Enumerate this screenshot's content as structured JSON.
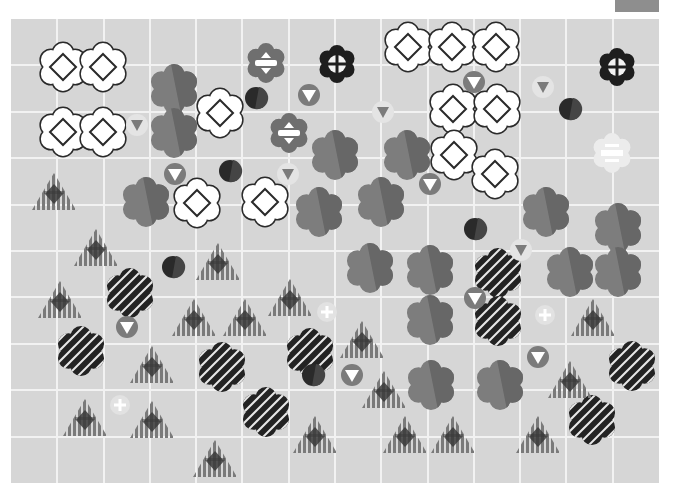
{
  "board": {
    "origin": [
      11,
      19
    ],
    "size": [
      648,
      464
    ],
    "columns": 14,
    "rows": 10,
    "colors": {
      "background": "#d6d6d6",
      "grid": "#f2f2f2",
      "corner_tab": "#8e8e8e",
      "white_flower_fill": "#ffffff",
      "white_flower_stroke": "#2a2a2a",
      "gray_flower_light": "#7d7d7d",
      "gray_flower_dark": "#676767",
      "dark_flower": "#232323",
      "triangle_stripe": "#7a7a7a",
      "triangle_core": "#3a3a3a",
      "gray_circle": "#7b7b7b",
      "light_circle": "#e4e4e4",
      "light_circle_arrow": "#7b7b7b",
      "dark_circle_a": "#2a2a2a",
      "dark_circle_b": "#454545"
    }
  },
  "pieces": {
    "white_diamond_flowers": [
      [
        63,
        67
      ],
      [
        103,
        67
      ],
      [
        63,
        132
      ],
      [
        103,
        132
      ],
      [
        220,
        113
      ],
      [
        197,
        203
      ],
      [
        265,
        202
      ],
      [
        408,
        47
      ],
      [
        452,
        47
      ],
      [
        496,
        47
      ],
      [
        453,
        109
      ],
      [
        497,
        109
      ],
      [
        454,
        155
      ],
      [
        495,
        174
      ]
    ],
    "gray_flowers": [
      [
        174,
        89
      ],
      [
        174,
        133
      ],
      [
        335,
        155
      ],
      [
        146,
        202
      ],
      [
        319,
        212
      ],
      [
        381,
        202
      ],
      [
        407,
        155
      ],
      [
        546,
        212
      ],
      [
        618,
        228
      ],
      [
        370,
        268
      ],
      [
        430,
        270
      ],
      [
        570,
        272
      ],
      [
        618,
        272
      ],
      [
        430,
        320
      ],
      [
        431,
        385
      ],
      [
        500,
        385
      ]
    ],
    "dark_striped_flowers": [
      [
        130,
        293
      ],
      [
        81,
        351
      ],
      [
        222,
        367
      ],
      [
        310,
        353
      ],
      [
        498,
        273
      ],
      [
        498,
        321
      ],
      [
        266,
        412
      ],
      [
        632,
        366
      ],
      [
        592,
        420
      ]
    ],
    "striped_triangles": [
      [
        54,
        192
      ],
      [
        96,
        248
      ],
      [
        218,
        262
      ],
      [
        60,
        300
      ],
      [
        194,
        318
      ],
      [
        245,
        318
      ],
      [
        290,
        298
      ],
      [
        362,
        340
      ],
      [
        152,
        365
      ],
      [
        384,
        390
      ],
      [
        570,
        380
      ],
      [
        85,
        418
      ],
      [
        152,
        420
      ],
      [
        315,
        435
      ],
      [
        405,
        435
      ],
      [
        453,
        435
      ],
      [
        538,
        435
      ],
      [
        215,
        459
      ],
      [
        593,
        318
      ]
    ],
    "gray_circle_down_arrows": [
      [
        309,
        95
      ],
      [
        175,
        174
      ],
      [
        430,
        184
      ],
      [
        474,
        82
      ],
      [
        127,
        327
      ],
      [
        352,
        375
      ],
      [
        538,
        357
      ],
      [
        475,
        298
      ]
    ],
    "light_circle_down_arrows": [
      [
        137,
        125
      ],
      [
        383,
        112
      ],
      [
        543,
        87
      ],
      [
        288,
        174
      ],
      [
        521,
        250
      ]
    ],
    "dark_circles": [
      [
        256,
        98
      ],
      [
        230,
        171
      ],
      [
        570,
        109
      ],
      [
        475,
        229
      ],
      [
        173,
        267
      ],
      [
        313,
        375
      ]
    ],
    "plus_circles": [
      [
        327,
        312
      ],
      [
        545,
        315
      ],
      [
        120,
        405
      ]
    ],
    "gray_equals_flowers": [
      [
        266,
        63
      ],
      [
        289,
        133
      ]
    ],
    "black_cross_flowers": [
      [
        337,
        64
      ],
      [
        617,
        67
      ]
    ],
    "faint_equals_flowers": [
      [
        612,
        153
      ]
    ]
  }
}
